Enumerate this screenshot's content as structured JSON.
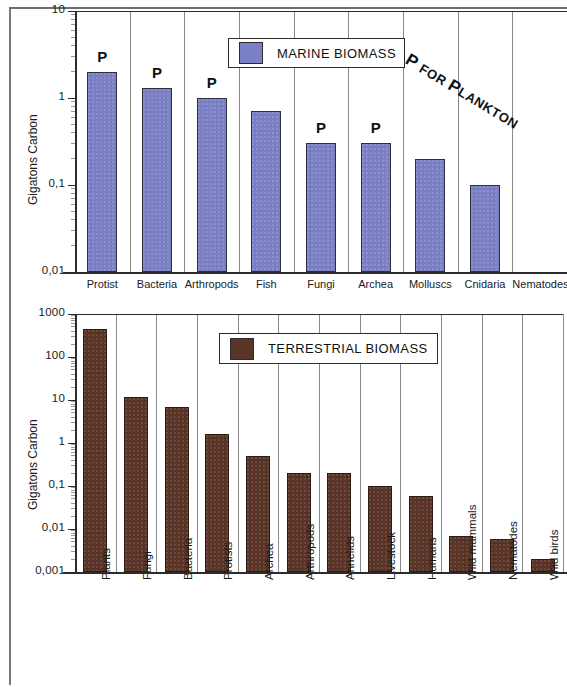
{
  "figure": {
    "background_color": "#ffffff",
    "marine_color": "#7b80c4",
    "terrestrial_color": "#5a3527",
    "annotation_text": "P FOR PLANKTON",
    "annotation_lead": "P",
    "annotation_mid": " FOR ",
    "annotation_lead2": "P",
    "annotation_tail": "LANKTON"
  },
  "chart_data": [
    {
      "type": "bar",
      "id": "marine-biomass",
      "title": "MARINE BIOMASS",
      "legend_label": "MARINE BIOMASS",
      "legend_position": "top-center",
      "xlabel": "",
      "ylabel": "Gigatons Carbon",
      "yscale": "log",
      "ylim": [
        0.01,
        10
      ],
      "ytick_labels": [
        "10",
        "1",
        "0,1",
        "0,01"
      ],
      "ytick_values": [
        10,
        1,
        0.1,
        0.01
      ],
      "grid": true,
      "color": "#7b80c4",
      "categories": [
        "Protist",
        "Bacteria",
        "Arthropods",
        "Fish",
        "Fungi",
        "Archea",
        "Molluscs",
        "Cnidaria",
        "Nematodes"
      ],
      "values": [
        2.0,
        1.3,
        1.0,
        0.7,
        0.3,
        0.3,
        0.2,
        0.1,
        null
      ],
      "point_labels": [
        "P",
        "P",
        "P",
        "",
        "P",
        "P",
        "",
        "",
        ""
      ],
      "annotation": "P FOR PLANKTON"
    },
    {
      "type": "bar",
      "id": "terrestrial-biomass",
      "title": "TERRESTRIAL BIOMASS",
      "legend_label": "TERRESTRIAL BIOMASS",
      "legend_position": "top-center",
      "xlabel": "",
      "ylabel": "Gigatons Carbon",
      "yscale": "log",
      "ylim": [
        0.001,
        1000
      ],
      "ytick_labels": [
        "1000",
        "100",
        "10",
        "1",
        "0,1",
        "0,01",
        "0,001"
      ],
      "ytick_values": [
        1000,
        100,
        10,
        1,
        0.1,
        0.01,
        0.001
      ],
      "grid": true,
      "color": "#5a3527",
      "categories": [
        "Plants",
        "Fungi",
        "Bacteria",
        "Protists",
        "Archea",
        "Arthropods",
        "Annelids",
        "Livestock",
        "Humans",
        "Wild mammals",
        "Nematodes",
        "Wild birds"
      ],
      "values": [
        450,
        12,
        7,
        1.6,
        0.5,
        0.2,
        0.2,
        0.1,
        0.06,
        0.007,
        0.006,
        0.002
      ],
      "point_labels": [
        "",
        "",
        "",
        "",
        "",
        "",
        "",
        "",
        "",
        "",
        "",
        ""
      ]
    }
  ]
}
